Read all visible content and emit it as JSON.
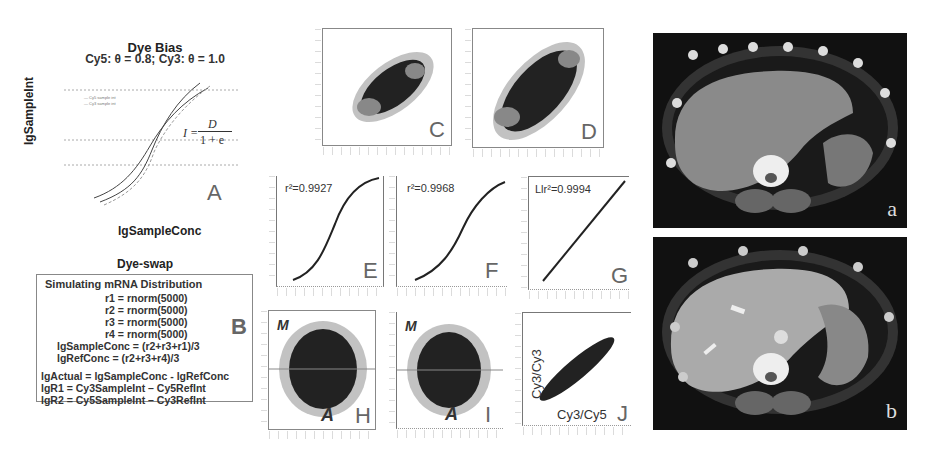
{
  "panel_a": {
    "title": "Dye Bias",
    "subtitle": "Cy5: θ = 0.8; Cy3: θ = 1.0",
    "y_label": "lgSampleInt",
    "x_label": "lgSampleConc",
    "legend": [
      "Cy5 sample int",
      "Cy3 sample int"
    ],
    "formula_lhs": "I =",
    "formula_num": "D",
    "formula_den": "1 + e",
    "letter": "A"
  },
  "panel_b": {
    "heading": "Dye-swap",
    "letter": "B",
    "lines": [
      "Simulating mRNA Distribution",
      "r1 = rnorm(5000)",
      "r2 = rnorm(5000)",
      "r3 = rnorm(5000)",
      "r4 = rnorm(5000)",
      "lgSampleConc = (r2+r3+r1)/3",
      "lgRefConc = (r2+r3+r4)/3",
      "",
      "lgActual = lgSampleConc - lgRefConc",
      "lgR1 = Cy3SampleInt – Cy5RefInt",
      "lgR2 = Cy5SampleInt – Cy3RefInt"
    ]
  },
  "panels_scatter": {
    "c": {
      "letter": "C"
    },
    "d": {
      "letter": "D"
    },
    "e": {
      "letter": "E",
      "stat": "r²=0.9927"
    },
    "f": {
      "letter": "F",
      "stat": "r²=0.9968"
    },
    "g": {
      "letter": "G",
      "stat": "Llr²=0.9994"
    },
    "h": {
      "letter": "H",
      "y_label": "M",
      "x_label": "A"
    },
    "i": {
      "letter": "I",
      "y_label": "M",
      "x_label": "A"
    },
    "j": {
      "letter": "J",
      "y_label": "Cy3/Cy3",
      "x_label": "Cy3/Cy5"
    }
  },
  "ct_images": {
    "top": {
      "label": "a"
    },
    "bottom": {
      "label": "b"
    }
  }
}
